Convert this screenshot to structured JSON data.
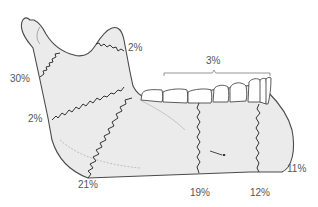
{
  "diagram": {
    "colors": {
      "bone_fill": "#ebebeb",
      "outline": "#4a4a4a",
      "fracture_line": "#333333",
      "label_text": "#555555",
      "bracket": "#888888"
    },
    "labels": {
      "condyle": "30%",
      "coronoid": "2%",
      "ramus": "2%",
      "angle": "21%",
      "alveolar": "3%",
      "body": "19%",
      "parasymphysis": "12%",
      "symphysis": "11%"
    }
  }
}
